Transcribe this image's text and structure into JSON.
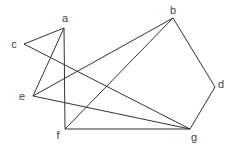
{
  "graph": {
    "nodes": [
      {
        "id": "a",
        "label": "a",
        "x": 64,
        "y": 28,
        "lx": 65,
        "ly": 22
      },
      {
        "id": "b",
        "label": "b",
        "x": 173,
        "y": 18,
        "lx": 173,
        "ly": 14
      },
      {
        "id": "c",
        "label": "c",
        "x": 24,
        "y": 44,
        "lx": 14,
        "ly": 48
      },
      {
        "id": "d",
        "label": "d",
        "x": 215,
        "y": 87,
        "lx": 221,
        "ly": 88
      },
      {
        "id": "e",
        "label": "e",
        "x": 33,
        "y": 96,
        "lx": 22,
        "ly": 100
      },
      {
        "id": "f",
        "label": "f",
        "x": 65,
        "y": 129,
        "lx": 58,
        "ly": 139
      },
      {
        "id": "g",
        "label": "g",
        "x": 190,
        "y": 129,
        "lx": 194,
        "ly": 141
      }
    ],
    "edges": [
      [
        "a",
        "c"
      ],
      [
        "c",
        "g"
      ],
      [
        "a",
        "e"
      ],
      [
        "a",
        "f"
      ],
      [
        "e",
        "b"
      ],
      [
        "e",
        "g"
      ],
      [
        "f",
        "b"
      ],
      [
        "f",
        "g"
      ],
      [
        "b",
        "d"
      ],
      [
        "d",
        "g"
      ]
    ]
  }
}
